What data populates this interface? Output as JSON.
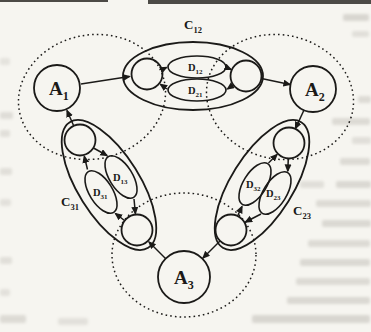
{
  "figure": {
    "nodes": {
      "a1": {
        "base": "A",
        "sub": "1"
      },
      "a2": {
        "base": "A",
        "sub": "2"
      },
      "a3": {
        "base": "A",
        "sub": "3"
      }
    },
    "channels": {
      "c12": {
        "base": "C",
        "sub": "12"
      },
      "c23": {
        "base": "C",
        "sub": "23"
      },
      "c31": {
        "base": "C",
        "sub": "31"
      }
    },
    "buffers": {
      "d12": {
        "base": "D",
        "sub": "12"
      },
      "d21": {
        "base": "D",
        "sub": "21"
      },
      "d13": {
        "base": "D",
        "sub": "13"
      },
      "d31": {
        "base": "D",
        "sub": "31"
      },
      "d32": {
        "base": "D",
        "sub": "32"
      },
      "d23": {
        "base": "D",
        "sub": "23"
      }
    },
    "colors": {
      "ink": "#1b1a18",
      "paper": "#f6f5f0",
      "bleed": "#8d8880"
    }
  }
}
